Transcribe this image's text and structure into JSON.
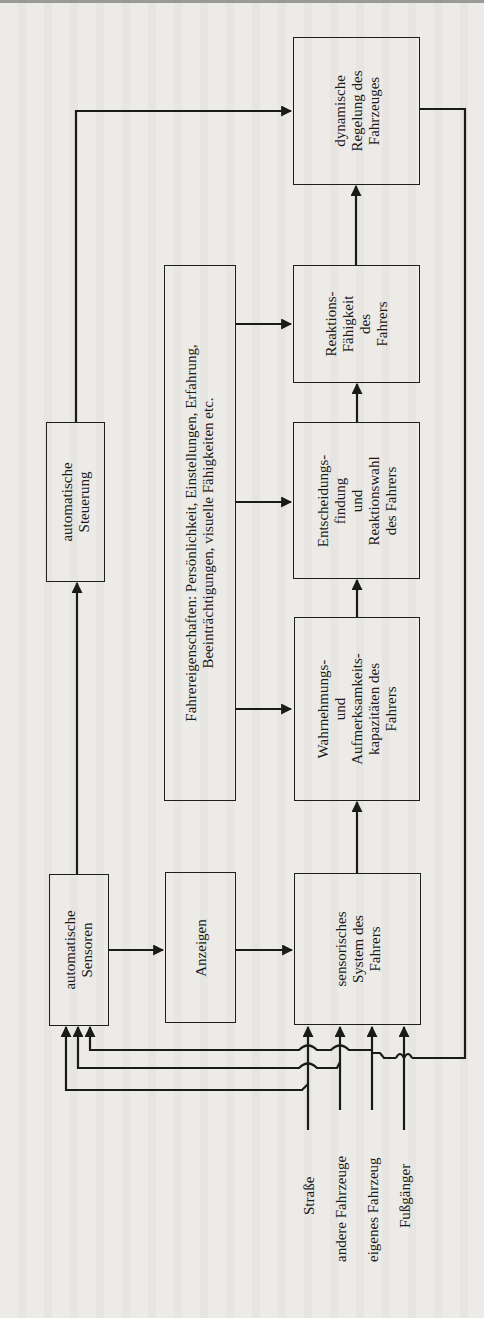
{
  "diagram": {
    "orientation": "rotated 90° counter-clockwise",
    "boxes": {
      "dynamische_regelung": {
        "lines": [
          "dynamische",
          "Regelung des",
          "Fahrzeuges"
        ]
      },
      "reaktionsfaehigkeit": {
        "lines": [
          "Reaktions-",
          "Fähigkeit",
          "des",
          "Fahrers"
        ]
      },
      "entscheidungsfindung": {
        "lines": [
          "Entscheidungs-",
          "findung",
          "und",
          "Reaktionswahl",
          "des Fahrers"
        ]
      },
      "wahrnehmung": {
        "lines": [
          "Wahrnehmungs-",
          "und",
          "Aufmerksamkeits-",
          "kapazitäten des",
          "Fahrers"
        ]
      },
      "sensorisches_system": {
        "lines": [
          "sensorisches",
          "System des",
          "Fahrers"
        ]
      },
      "fahrereigenschaften": {
        "lines": [
          "Fahrereigenschaften: Persönlichkeit, Einstellungen, Erfahrung,",
          "Beeinträchtigungen, visuelle Fähigkeiten etc."
        ]
      },
      "anzeigen": {
        "lines": [
          "Anzeigen"
        ]
      },
      "automatische_steuerung": {
        "lines": [
          "automatische",
          "Steuerung"
        ]
      },
      "automatische_sensoren": {
        "lines": [
          "automatische",
          "Sensoren"
        ]
      }
    },
    "inputs": [
      "Straße",
      "andere Fahrzeuge",
      "eigenes Fahrzeug",
      "Fußgänger"
    ],
    "edges": [
      [
        "automatische Sensoren",
        "Anzeigen"
      ],
      [
        "Anzeigen",
        "sensorisches System des Fahrers"
      ],
      [
        "automatische Sensoren",
        "automatische Steuerung"
      ],
      [
        "automatische Steuerung",
        "dynamische Regelung des Fahrzeuges"
      ],
      [
        "sensorisches System des Fahrers",
        "Wahrnehmungs- und Aufmerksamkeitskapazitäten des Fahrers"
      ],
      [
        "Wahrnehmungs- und Aufmerksamkeitskapazitäten des Fahrers",
        "Entscheidungsfindung und Reaktionswahl des Fahrers"
      ],
      [
        "Entscheidungsfindung und Reaktionswahl des Fahrers",
        "Reaktions-Fähigkeit des Fahrers"
      ],
      [
        "Reaktions-Fähigkeit des Fahrers",
        "dynamische Regelung des Fahrzeuges"
      ],
      [
        "Fahrereigenschaften",
        "Wahrnehmungs- und Aufmerksamkeitskapazitäten des Fahrers"
      ],
      [
        "Fahrereigenschaften",
        "Entscheidungsfindung und Reaktionswahl des Fahrers"
      ],
      [
        "Fahrereigenschaften",
        "Reaktions-Fähigkeit des Fahrers"
      ],
      [
        "dynamische Regelung des Fahrzeuges",
        "eigenes Fahrzeug (feedback)"
      ],
      [
        "Straße",
        "sensorisches System des Fahrers"
      ],
      [
        "andere Fahrzeuge",
        "sensorisches System des Fahrers"
      ],
      [
        "eigenes Fahrzeug",
        "sensorisches System des Fahrers"
      ],
      [
        "Fußgänger",
        "sensorisches System des Fahrers"
      ],
      [
        "Straße",
        "automatische Sensoren"
      ],
      [
        "andere Fahrzeuge",
        "automatische Sensoren"
      ],
      [
        "eigenes Fahrzeug",
        "automatische Sensoren"
      ]
    ]
  }
}
